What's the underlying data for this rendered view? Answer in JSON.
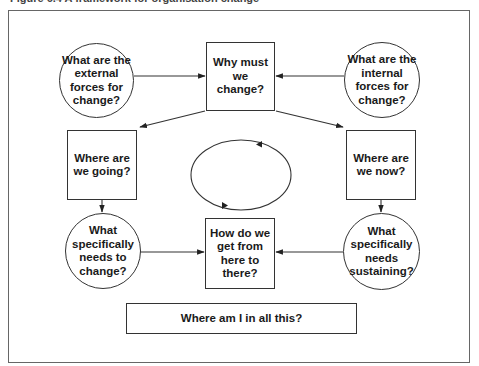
{
  "figure": {
    "title": "Figure 6.4 A framework for organisation change"
  },
  "nodes": {
    "external_forces": {
      "shape": "circle",
      "label": "What are the external forces for change?"
    },
    "why_change": {
      "shape": "box",
      "label": "Why must we change?"
    },
    "internal_forces": {
      "shape": "circle",
      "label": "What are the internal forces for change?"
    },
    "where_going": {
      "shape": "box",
      "label": "Where are we going?"
    },
    "where_now": {
      "shape": "box",
      "label": "Where are we now?"
    },
    "needs_change": {
      "shape": "circle",
      "label": "What specifically needs to change?"
    },
    "how_get_there": {
      "shape": "box",
      "label": "How do we get from here to there?"
    },
    "needs_sustaining": {
      "shape": "circle",
      "label": "What specifically needs sustaining?"
    },
    "where_am_i": {
      "shape": "box",
      "label": "Where am I in all this?"
    }
  },
  "edges": [
    {
      "from": "external_forces",
      "to": "why_change"
    },
    {
      "from": "internal_forces",
      "to": "why_change"
    },
    {
      "from": "why_change",
      "to": "where_going"
    },
    {
      "from": "why_change",
      "to": "where_now"
    },
    {
      "from": "where_going",
      "to": "needs_change"
    },
    {
      "from": "where_now",
      "to": "needs_sustaining"
    },
    {
      "from": "needs_change",
      "to": "how_get_there"
    },
    {
      "from": "needs_sustaining",
      "to": "how_get_there"
    }
  ],
  "center_cycle": {
    "shape": "ellipse",
    "direction": "counter-clockwise",
    "arrowheads": 2
  },
  "colors": {
    "stroke": "#333333",
    "text": "#1a1a1a",
    "frame": "#666666",
    "background": "#ffffff"
  }
}
